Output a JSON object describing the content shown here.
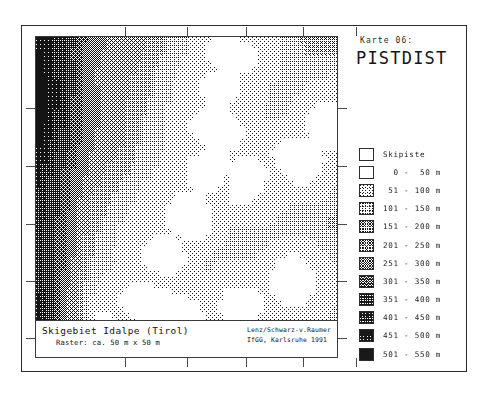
{
  "map_number": "Karte 06:",
  "map_title": "PISTDIST",
  "caption": {
    "title": "Skigebiet Idalpe (Tirol)",
    "subtitle": "Raster: ca. 50 m x 50 m",
    "credit_line_1": "Lenz/Schwarz-v.Raumer",
    "credit_line_2": "IfGG, Karlsruhe  1991"
  },
  "legend": {
    "items": [
      {
        "label": "Skipiste",
        "level": 0,
        "swatch": "white"
      },
      {
        "label": "  0 -  50 m",
        "level": 1,
        "swatch": "white"
      },
      {
        "label": " 51 - 100 m",
        "level": 2,
        "swatch": "dither-10"
      },
      {
        "label": "101 - 150 m",
        "level": 3,
        "swatch": "dither-20"
      },
      {
        "label": "151 - 200 m",
        "level": 4,
        "swatch": "dither-30"
      },
      {
        "label": "201 - 250 m",
        "level": 5,
        "swatch": "dither-40"
      },
      {
        "label": "251 - 300 m",
        "level": 6,
        "swatch": "dither-50"
      },
      {
        "label": "301 - 350 m",
        "level": 7,
        "swatch": "dither-60"
      },
      {
        "label": "351 - 400 m",
        "level": 8,
        "swatch": "dither-70"
      },
      {
        "label": "401 - 450 m",
        "level": 9,
        "swatch": "dither-80"
      },
      {
        "label": "451 - 500 m",
        "level": 10,
        "swatch": "dither-90"
      },
      {
        "label": "501 - 550 m",
        "level": 11,
        "swatch": "black"
      }
    ]
  },
  "chart_data": {
    "type": "heatmap",
    "title": "PISTDIST",
    "subtitle": "Skigebiet Idalpe (Tirol)",
    "xlabel": "",
    "ylabel": "",
    "grid": false,
    "legend_position": "right",
    "cell_size_m": 50,
    "value_unit": "m",
    "class_breaks": [
      0,
      50,
      100,
      150,
      200,
      250,
      300,
      350,
      400,
      450,
      500,
      550
    ],
    "class_labels": [
      "0 - 50 m",
      "51 - 100 m",
      "101 - 150 m",
      "151 - 200 m",
      "201 - 250 m",
      "251 - 300 m",
      "301 - 350 m",
      "351 - 400 m",
      "401 - 450 m",
      "451 - 500 m",
      "501 - 550 m"
    ],
    "grid_cols": 52,
    "grid_rows": 54,
    "x_ticks": [
      0,
      10,
      20,
      30,
      40,
      50
    ],
    "y_ticks": [
      0,
      10,
      20,
      30,
      40,
      50
    ],
    "values_note": "Distance-to-piste raster, 0 (white, on piste) to 550 m (black).",
    "hotspots": [
      {
        "name": "west-ridge-dark-band",
        "col_range": [
          2,
          12
        ],
        "row_range": [
          20,
          46
        ],
        "class": 11
      },
      {
        "name": "central-valley-light",
        "col_range": [
          14,
          34
        ],
        "row_range": [
          8,
          30
        ],
        "class": 1
      },
      {
        "name": "east-slope-mid",
        "col_range": [
          36,
          50
        ],
        "row_range": [
          22,
          34
        ],
        "class": 6
      },
      {
        "name": "north-edge-mid",
        "col_range": [
          12,
          30
        ],
        "row_range": [
          0,
          6
        ],
        "class": 5
      },
      {
        "name": "south-basin-light",
        "col_range": [
          10,
          46
        ],
        "row_range": [
          40,
          53
        ],
        "class": 2
      }
    ]
  },
  "ticks": {
    "top": [
      90,
      152,
      211,
      268,
      321
    ],
    "bottom": [
      90,
      152,
      211,
      268,
      321
    ],
    "left": [
      72,
      130,
      188,
      245,
      302
    ],
    "right": [
      72,
      130,
      188,
      245,
      302
    ]
  }
}
